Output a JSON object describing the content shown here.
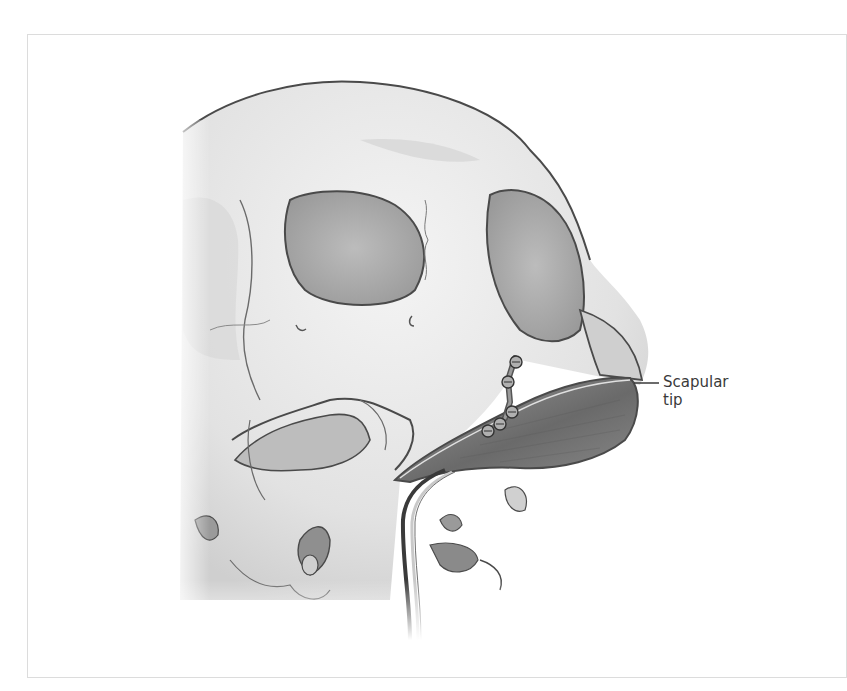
{
  "figure": {
    "labels": [
      {
        "line1": "Scapular",
        "line2": "tip"
      }
    ]
  },
  "colors": {
    "outline": "#4a4a4a",
    "bone_light": "#e9e9e9",
    "bone_mid": "#c9c9c9",
    "cavity": "#9e9e9e",
    "flap": "#7d7d7d",
    "frame": "#dcdcdc",
    "label_text": "#3a3a3a"
  }
}
